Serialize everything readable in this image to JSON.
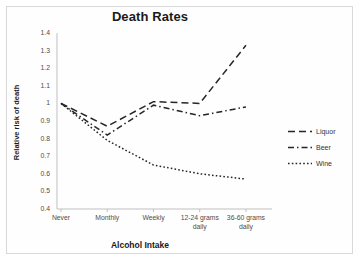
{
  "chart_data": {
    "type": "line",
    "title": "Death Rates",
    "xlabel": "Alcohol Intake",
    "ylabel": "Relative risk of death",
    "categories": [
      "Never",
      "Monthly",
      "Weekly",
      "12-24 grams daily",
      "36-60 grams daily"
    ],
    "category_lines": [
      [
        "Never"
      ],
      [
        "Monthly"
      ],
      [
        "Weekly"
      ],
      [
        "12-24 grams",
        "daily"
      ],
      [
        "36-60 grams",
        "daily"
      ]
    ],
    "ylim": [
      0.4,
      1.4
    ],
    "yticks": [
      "1.4",
      "1.3",
      "1.2",
      "1.1",
      "1",
      "0.9",
      "0.8",
      "0.7",
      "0.6",
      "0.5",
      "0.4"
    ],
    "grid": false,
    "legend_position": "right",
    "series": [
      {
        "name": "Liquor",
        "values": [
          1.0,
          0.87,
          1.01,
          1.0,
          1.33
        ],
        "dash": "long-dash",
        "color": "#262626"
      },
      {
        "name": "Beer",
        "values": [
          1.0,
          0.82,
          0.99,
          0.93,
          0.98
        ],
        "dash": "dash-dot",
        "color": "#262626"
      },
      {
        "name": "Wine",
        "values": [
          1.0,
          0.79,
          0.65,
          0.6,
          0.57
        ],
        "dash": "dotted",
        "color": "#262626"
      }
    ]
  },
  "axis": {
    "line_color": "#bfbfbf"
  }
}
